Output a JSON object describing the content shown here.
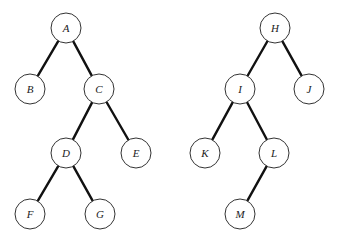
{
  "diagram": {
    "type": "binary-trees",
    "node_radius": 15,
    "trees": [
      {
        "root": "A",
        "nodes": [
          {
            "id": "A",
            "label": "A",
            "x": 66,
            "y": 28
          },
          {
            "id": "B",
            "label": "B",
            "x": 30,
            "y": 89
          },
          {
            "id": "C",
            "label": "C",
            "x": 99,
            "y": 89
          },
          {
            "id": "D",
            "label": "D",
            "x": 66,
            "y": 153
          },
          {
            "id": "E",
            "label": "E",
            "x": 136,
            "y": 153
          },
          {
            "id": "F",
            "label": "F",
            "x": 30,
            "y": 214
          },
          {
            "id": "G",
            "label": "G",
            "x": 100,
            "y": 214
          }
        ],
        "edges": [
          [
            "A",
            "B"
          ],
          [
            "A",
            "C"
          ],
          [
            "C",
            "D"
          ],
          [
            "C",
            "E"
          ],
          [
            "D",
            "F"
          ],
          [
            "D",
            "G"
          ]
        ]
      },
      {
        "root": "H",
        "nodes": [
          {
            "id": "H",
            "label": "H",
            "x": 275,
            "y": 28
          },
          {
            "id": "I",
            "label": "I",
            "x": 240,
            "y": 89
          },
          {
            "id": "J",
            "label": "J",
            "x": 309,
            "y": 89
          },
          {
            "id": "K",
            "label": "K",
            "x": 205,
            "y": 153
          },
          {
            "id": "L",
            "label": "L",
            "x": 274,
            "y": 153
          },
          {
            "id": "M",
            "label": "M",
            "x": 240,
            "y": 214
          }
        ],
        "edges": [
          [
            "H",
            "I"
          ],
          [
            "H",
            "J"
          ],
          [
            "I",
            "K"
          ],
          [
            "I",
            "L"
          ],
          [
            "L",
            "M"
          ]
        ]
      }
    ]
  }
}
